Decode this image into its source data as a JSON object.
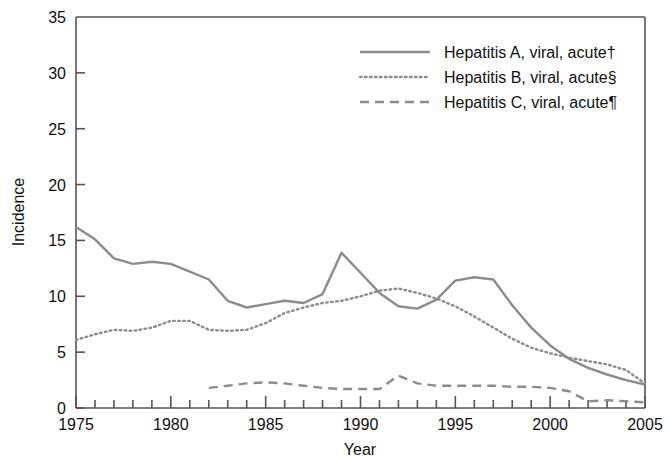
{
  "chart_data": {
    "type": "line",
    "title": "",
    "xlabel": "Year",
    "ylabel": "Incidence",
    "xlim": [
      1975,
      2005
    ],
    "ylim": [
      0,
      35
    ],
    "ytick_values": [
      0,
      5,
      10,
      15,
      20,
      25,
      30,
      35
    ],
    "ytick_labels": [
      "0",
      "5",
      "10",
      "15",
      "20",
      "25",
      "30",
      "35"
    ],
    "xtick_major_values": [
      1975,
      1980,
      1985,
      1990,
      1995,
      2000,
      2005
    ],
    "xtick_major_labels": [
      "1975",
      "1980",
      "1985",
      "1990",
      "1995",
      "2000",
      "2005"
    ],
    "xtick_minor_step": 1,
    "grid": false,
    "legend_position": "top-right",
    "line_color": "#8c8c8c",
    "axis_color": "#555555",
    "x": [
      1975,
      1976,
      1977,
      1978,
      1979,
      1980,
      1981,
      1982,
      1983,
      1984,
      1985,
      1986,
      1987,
      1988,
      1989,
      1990,
      1991,
      1992,
      1993,
      1994,
      1995,
      1996,
      1997,
      1998,
      1999,
      2000,
      2001,
      2002,
      2003,
      2004,
      2005
    ],
    "series": [
      {
        "name": "Hepatitis A, viral, acute†",
        "dash": "solid",
        "values": [
          16.2,
          15.1,
          14.0,
          12.9,
          13.1,
          12.8,
          12.7,
          13.4,
          12.4,
          11.8,
          11.2,
          10.5,
          9.9,
          9.6,
          9.6,
          9.9,
          9.3,
          9.4,
          10.2,
          11.4,
          13.8,
          12.1,
          10.4,
          9.4,
          9.0,
          9.1,
          9.6,
          10.6,
          11.6,
          11.6,
          11.7
        ]
      },
      {
        "name": "Hepatitis B, viral, acute§",
        "dash": "dotted",
        "values": [
          6.1,
          6.5,
          6.9,
          6.9,
          7.2,
          7.8,
          7.7,
          7.0,
          6.8,
          6.9,
          7.0,
          7.6,
          8.5,
          9.0,
          9.4,
          9.6,
          9.9,
          10.3,
          10.6,
          10.7,
          10.4,
          10.1,
          9.7,
          9.2,
          8.6,
          8.0,
          7.3,
          6.7,
          6.1,
          5.5,
          5.0
        ]
      },
      {
        "name": "Hepatitis C, viral, acute¶",
        "dash": "dashed",
        "values": [
          null,
          null,
          null,
          null,
          null,
          null,
          null,
          1.8,
          2.0,
          2.2,
          2.3,
          2.2,
          2.0,
          1.8,
          1.7,
          1.7,
          1.7,
          1.6,
          1.6,
          1.7,
          2.1,
          2.9,
          2.6,
          2.0,
          2.0,
          2.0,
          1.9,
          1.9,
          1.8,
          1.5,
          1.4
        ]
      }
    ],
    "series_ordered_note": "",
    "series_values_by_year": {
      "hepatitis_a": {
        "1975": 16.2,
        "1976": 15.1,
        "1977": 13.4,
        "1978": 12.9,
        "1979": 13.1,
        "1980": 12.9,
        "1981": 12.2,
        "1982": 11.5,
        "1983": 9.6,
        "1984": 9.0,
        "1985": 9.3,
        "1986": 9.6,
        "1987": 9.4,
        "1988": 10.2,
        "1989": 13.9,
        "1990": 12.1,
        "1991": 10.3,
        "1992": 9.1,
        "1993": 8.9,
        "1994": 9.7,
        "1995": 11.4,
        "1996": 11.7,
        "1997": 11.5,
        "1998": 9.2,
        "1999": 7.2,
        "2000": 5.6,
        "2001": 4.4,
        "2002": 3.6,
        "2003": 3.0,
        "2004": 2.5,
        "2005": 2.1
      },
      "hepatitis_b": {
        "1975": 6.1,
        "1976": 6.6,
        "1977": 7.0,
        "1978": 6.9,
        "1979": 7.2,
        "1980": 7.8,
        "1981": 7.8,
        "1982": 7.0,
        "1983": 6.9,
        "1984": 7.0,
        "1985": 7.6,
        "1986": 8.5,
        "1987": 9.0,
        "1988": 9.4,
        "1989": 9.6,
        "1990": 10.0,
        "1991": 10.5,
        "1992": 10.7,
        "1993": 10.3,
        "1994": 9.8,
        "1995": 9.1,
        "1996": 8.2,
        "1997": 7.2,
        "1998": 6.2,
        "1999": 5.4,
        "2000": 4.9,
        "2001": 4.5,
        "2002": 4.2,
        "2003": 3.9,
        "2004": 3.4,
        "2005": 2.2
      },
      "hepatitis_c": {
        "1982": 1.8,
        "1983": 2.0,
        "1984": 2.2,
        "1985": 2.3,
        "1986": 2.2,
        "1987": 2.0,
        "1988": 1.8,
        "1989": 1.7,
        "1990": 1.7,
        "1991": 1.7,
        "1992": 2.9,
        "1993": 2.2,
        "1994": 2.0,
        "1995": 2.0,
        "1996": 2.0,
        "1997": 2.0,
        "1998": 1.9,
        "1999": 1.9,
        "2000": 1.8,
        "2001": 1.5,
        "2002": 0.6,
        "2003": 0.7,
        "2004": 0.6,
        "2005": 0.5
      }
    }
  },
  "legend": {
    "items": [
      {
        "label": "Hepatitis A, viral, acute†",
        "style": "solid"
      },
      {
        "label": "Hepatitis B, viral, acute§",
        "style": "dotted"
      },
      {
        "label": "Hepatitis C, viral, acute¶",
        "style": "dashed"
      }
    ]
  },
  "axes": {
    "y_title": "Incidence",
    "x_title": "Year",
    "y_labels": [
      "35",
      "30",
      "25",
      "20",
      "15",
      "10",
      "5",
      "0"
    ],
    "x_labels": [
      "1975",
      "1980",
      "1985",
      "1990",
      "1995",
      "2000",
      "2005"
    ]
  }
}
